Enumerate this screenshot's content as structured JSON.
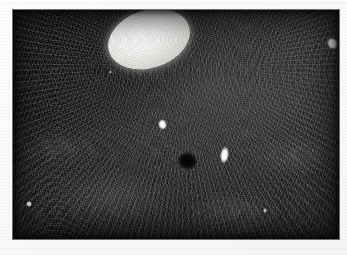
{
  "figure": {
    "kind": "scanned-photomicrograph",
    "medium": "black-and-white photographic print",
    "caption": "",
    "canvas": {
      "width_px": 347,
      "height_px": 255,
      "background_hex": "#fdfdfc"
    },
    "plate": {
      "left_px": 13,
      "top_px": 10,
      "width_px": 326,
      "height_px": 229,
      "base_hex": "#0d0d0d",
      "border_hex": "#000000"
    },
    "palette": {
      "paper_white": "#fdfdfc",
      "field_dark": "#121211",
      "field_mid": "#2a2a28",
      "field_light": "#3a3a38",
      "lesion_bright": "#f2f2f0",
      "lesion_edge": "#d6d6d2",
      "focus_black": "#030303",
      "speck_white": "#ffffff"
    },
    "margins": {
      "left_px": 13,
      "top_px": 10,
      "right_px": 8,
      "bottom_px": 16
    }
  },
  "features": [
    {
      "id": "bright-lesion",
      "label": "bright oval lesion",
      "shape": "ellipse",
      "center_px": [
        149,
        39
      ],
      "width_px": 84,
      "height_px": 58,
      "rotation_deg": -18,
      "tone": "near-white",
      "color_hex": "#f2f2f0"
    },
    {
      "id": "dark-focus",
      "label": "dark round focus",
      "shape": "ellipse",
      "center_px": [
        187,
        161
      ],
      "width_px": 21,
      "height_px": 18,
      "rotation_deg": 12,
      "tone": "black",
      "color_hex": "#030303"
    },
    {
      "id": "speck-center",
      "label": "white speck (centre)",
      "shape": "irregular",
      "center_px": [
        162,
        124
      ],
      "width_px": 9,
      "height_px": 11,
      "tone": "white",
      "color_hex": "#ffffff"
    },
    {
      "id": "speck-right",
      "label": "white speck (right of focus)",
      "shape": "irregular-elongate",
      "center_px": [
        224,
        155
      ],
      "width_px": 9,
      "height_px": 18,
      "tone": "white",
      "color_hex": "#ffffff"
    },
    {
      "id": "speck-edge",
      "label": "white speck (right margin)",
      "shape": "irregular",
      "center_px": [
        332,
        43
      ],
      "width_px": 11,
      "height_px": 13,
      "tone": "white",
      "color_hex": "#ffffff"
    },
    {
      "id": "speck-lower-left",
      "label": "white dot (lower left)",
      "shape": "dot",
      "center_px": [
        29,
        204
      ],
      "width_px": 6,
      "height_px": 6,
      "tone": "white",
      "color_hex": "#ffffff"
    }
  ],
  "texture": {
    "description": "fine fibrous striations with radiating fan pattern emanating from the bright lesion and swirling whorls in the lower field",
    "radiation_origin_pct": [
      52,
      24
    ],
    "grain": "photographic silver grain",
    "darkest_quadrant": "upper-left"
  }
}
